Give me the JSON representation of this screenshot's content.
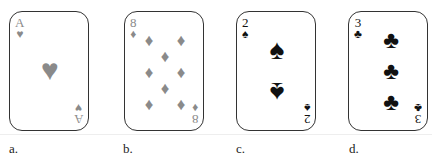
{
  "cards": [
    {
      "rank": "A",
      "suit_icon": "♥",
      "suit": "hearts",
      "label": "a."
    },
    {
      "rank": "8",
      "suit_icon": "♦",
      "suit": "diamonds",
      "label": "b."
    },
    {
      "rank": "2",
      "suit_icon": "♠",
      "suit": "spades",
      "label": "c."
    },
    {
      "rank": "3",
      "suit_icon": "♣",
      "suit": "clubs",
      "label": "d."
    }
  ],
  "colors": {
    "red_suit": "#8a8a8a",
    "black_suit": "#111111",
    "border": "#333333"
  }
}
